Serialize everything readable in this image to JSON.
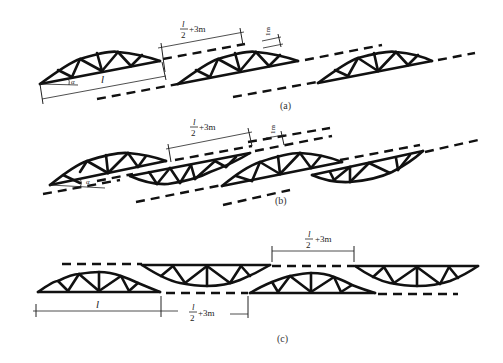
{
  "diagram": {
    "colors": {
      "line": "#111111",
      "background": "#ffffff"
    },
    "panels": [
      {
        "id": "a",
        "caption": "(a)",
        "description": "Sloped layout: trusses in parallel inclined rows, staggered",
        "labels": {
          "span": "l",
          "angle": "α",
          "gap_num": "l",
          "gap_den": "2",
          "gap_suffix": "+3m",
          "offset": "1m"
        }
      },
      {
        "id": "b",
        "caption": "(b)",
        "description": "Sloped layout: upright and inverted trusses alternating",
        "labels": {
          "angle": "α",
          "gap_num": "l",
          "gap_den": "2",
          "gap_suffix": "+3m",
          "offset": "1m"
        }
      },
      {
        "id": "c",
        "caption": "(c)",
        "description": "Horizontal layout: upright and inverted trusses alternating in two rows",
        "labels": {
          "span": "l",
          "gap_top_num": "l",
          "gap_top_den": "2",
          "gap_top_suffix": "+3m",
          "gap_bottom_num": "l",
          "gap_bottom_den": "2",
          "gap_bottom_suffix": "+3m"
        }
      }
    ]
  }
}
